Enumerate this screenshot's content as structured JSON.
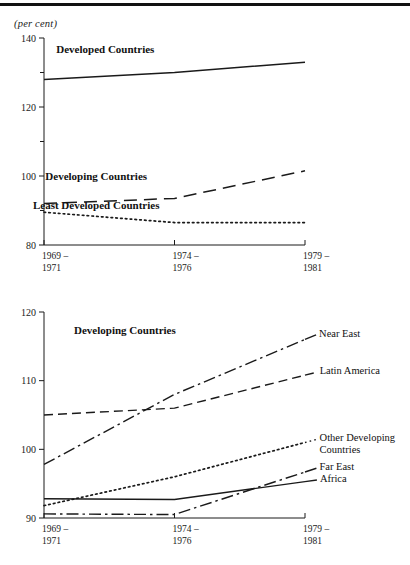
{
  "page": {
    "unit_note": "(per cent)"
  },
  "chart_data": [
    {
      "id": "top",
      "type": "line",
      "title": "",
      "xlabel": "",
      "ylabel": "(per cent)",
      "categories": [
        "1969 –\n1971",
        "1974 –\n1976",
        "1979 –\n1981"
      ],
      "x": [
        0,
        1,
        2
      ],
      "ylim": [
        80,
        140
      ],
      "yticks": [
        80,
        100,
        120,
        140
      ],
      "yminorticks": [
        90,
        110,
        130
      ],
      "grid": false,
      "legend_position": "inline-annotation",
      "series": [
        {
          "name": "Developed Countries",
          "style": "solid",
          "values": [
            128.0,
            130.0,
            133.0
          ],
          "label_x": 0.47,
          "label_y": 136.5
        },
        {
          "name": "Developing Countries",
          "style": "long-dash",
          "values": [
            92.0,
            93.5,
            101.5
          ],
          "label_x": 0.4,
          "label_y": 99.6
        },
        {
          "name": "Least Developed Countries",
          "style": "dotted",
          "values": [
            89.5,
            86.5,
            86.5
          ],
          "label_x": 0.4,
          "label_y": 91.2
        }
      ]
    },
    {
      "id": "bottom",
      "type": "line",
      "title": "Developing Countries",
      "xlabel": "",
      "ylabel": "",
      "categories": [
        "1969 –\n1971",
        "1974 –\n1976",
        "1979 –\n1981"
      ],
      "x": [
        0,
        1,
        2
      ],
      "ylim": [
        90,
        120
      ],
      "yticks": [
        90,
        100,
        110,
        120
      ],
      "yminorticks": [],
      "grid": false,
      "legend_position": "right-of-line-ends",
      "series": [
        {
          "name": "Near East",
          "style": "dash-dot",
          "values": [
            97.8,
            108.0,
            116.0
          ]
        },
        {
          "name": "Latin America",
          "style": "dashed",
          "values": [
            105.0,
            106.0,
            110.8
          ]
        },
        {
          "name": "Other Developing\nCountries",
          "style": "dotted",
          "values": [
            91.8,
            96.0,
            101.0
          ]
        },
        {
          "name": "Far East",
          "style": "dash-dot",
          "values": [
            90.6,
            90.5,
            96.7
          ]
        },
        {
          "name": "Africa",
          "style": "solid",
          "values": [
            92.8,
            92.7,
            95.3
          ]
        }
      ]
    }
  ]
}
